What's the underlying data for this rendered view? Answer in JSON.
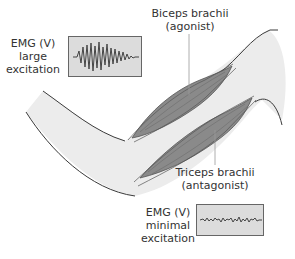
{
  "colors": {
    "arm_fill": "#ececec",
    "outline": "#3a3a3a",
    "muscle_fill": "#8a8a8a",
    "muscle_stroke": "#555555",
    "emg_box_fill": "#dcdcdc",
    "emg_trace": "#444444",
    "text": "#333333"
  },
  "labels": {
    "biceps": {
      "line1": "Biceps brachii",
      "line2": "(agonist)"
    },
    "triceps": {
      "line1": "Triceps brachii",
      "line2": "(antagonist)"
    },
    "emg_large": {
      "line1": "EMG (V)",
      "line2": "large",
      "line3": "excitation"
    },
    "emg_minimal": {
      "line1": "EMG (V)",
      "line2": "minimal",
      "line3": "excitation"
    }
  },
  "emg_traces": {
    "large": {
      "amplitude": "large",
      "description": "high-amplitude burst signal"
    },
    "minimal": {
      "amplitude": "minimal",
      "description": "low-amplitude flat noise signal"
    }
  }
}
